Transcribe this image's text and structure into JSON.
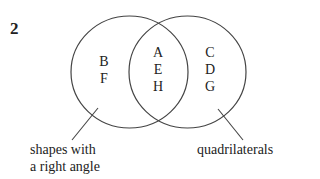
{
  "question_number": "2",
  "diagram": {
    "type": "venn",
    "sets": [
      {
        "name": "shapes with a right angle",
        "label_lines": [
          "shapes with",
          "a right angle"
        ]
      },
      {
        "name": "quadrilaterals",
        "label_lines": [
          "quadrilaterals"
        ]
      }
    ],
    "regions": {
      "left_only": [
        "B",
        "F"
      ],
      "intersection": [
        "A",
        "E",
        "H"
      ],
      "right_only": [
        "C",
        "D",
        "G"
      ]
    },
    "line_color": "#444444"
  }
}
